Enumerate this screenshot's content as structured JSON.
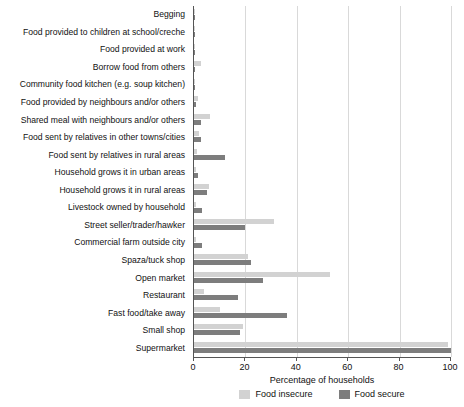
{
  "chart_data": {
    "type": "bar",
    "orientation": "horizontal",
    "title": "",
    "xlabel": "Percentage of households",
    "ylabel": "",
    "xlim": [
      0,
      100
    ],
    "xticks": [
      0,
      20,
      40,
      60,
      80,
      100
    ],
    "grid": true,
    "legend_position": "bottom",
    "categories": [
      "Begging",
      "Food provided to children at school/creche",
      "Food provided at work",
      "Borrow food from others",
      "Community food kitchen (e.g. soup kitchen)",
      "Food provided by neighbours and/or others",
      "Shared meal with neighbours and/or others",
      "Food sent by relatives in other towns/cities",
      "Food sent by relatives in rural areas",
      "Household grows it in urban areas",
      "Household grows it in rural areas",
      "Livestock owned by household",
      "Street seller/trader/hawker",
      "Commercial farm outside city",
      "Spaza/tuck shop",
      "Open market",
      "Restaurant",
      "Fast food/take away",
      "Small shop",
      "Supermarket"
    ],
    "series": [
      {
        "name": "Food insecure",
        "color": "#d2d2d2",
        "values": [
          0.3,
          0.4,
          0.4,
          2.6,
          0.3,
          1.6,
          6.2,
          2.0,
          1.0,
          0.6,
          6.0,
          0.8,
          31.0,
          0.6,
          21.0,
          53.0,
          4.0,
          10.0,
          19.0,
          99.0
        ]
      },
      {
        "name": "Food secure",
        "color": "#7d7d7d",
        "values": [
          0.0,
          0.2,
          0.3,
          0.4,
          0.2,
          0.8,
          2.6,
          2.6,
          12.0,
          1.6,
          5.0,
          3.0,
          20.0,
          3.0,
          22.0,
          27.0,
          17.0,
          36.0,
          18.0,
          100.0
        ]
      }
    ]
  },
  "legend": {
    "items": [
      {
        "label": "Food insecure",
        "color": "#d2d2d2"
      },
      {
        "label": "Food secure",
        "color": "#7d7d7d"
      }
    ]
  },
  "axis": {
    "x_title": "Percentage of households",
    "tick_labels": [
      "0",
      "20",
      "40",
      "60",
      "80",
      "100"
    ]
  }
}
